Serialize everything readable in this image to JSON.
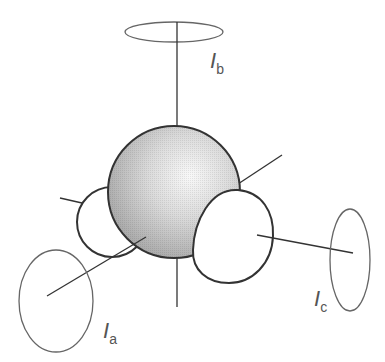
{
  "diagram": {
    "labels": {
      "a": {
        "symbol": "I",
        "subscript": "a"
      },
      "b": {
        "symbol": "I",
        "subscript": "b"
      },
      "c": {
        "symbol": "I",
        "subscript": "c"
      }
    },
    "colors": {
      "stroke": "#333333",
      "ellipse_stroke": "#666666",
      "sphere_light": "#f4f4f4",
      "sphere_dark": "#a8a8a8"
    }
  }
}
